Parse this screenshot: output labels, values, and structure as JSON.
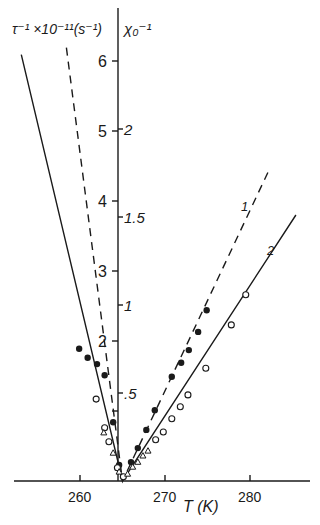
{
  "chart_data": {
    "type": "scatter",
    "title": "",
    "xlabel": "T (K)",
    "ylabel_left": "τ⁻¹ ×10⁻¹¹(s⁻¹)",
    "ylabel_right": "χ₀⁻¹",
    "xlim": [
      253,
      287
    ],
    "ylim_left": [
      0,
      6.7
    ],
    "ylim_right": [
      0,
      2.7
    ],
    "x_ticks": [
      260,
      270,
      280
    ],
    "y_ticks_left": [
      1,
      2,
      3,
      4,
      5,
      6
    ],
    "y_tick_labels_left": [
      "",
      "2",
      "3",
      "4",
      "5",
      "6"
    ],
    "y_ticks_right": [
      0.5,
      1,
      1.5,
      2
    ],
    "y_tick_labels_right": [
      ".5",
      "1",
      "1.5",
      "2"
    ],
    "grid": false,
    "legend": "none",
    "annotations": [
      {
        "text": "1",
        "near": "dashed line (right branch)"
      },
      {
        "text": "2",
        "near": "solid line (right branch)"
      }
    ],
    "series": [
      {
        "name": "τ⁻¹ (filled circles)",
        "marker": "filled-circle",
        "points": [
          [
            259.9,
            1.89
          ],
          [
            260.9,
            1.76
          ],
          [
            262.0,
            1.67
          ],
          [
            262.9,
            1.51
          ],
          [
            263.9,
            0.84
          ],
          [
            264.6,
            0.23
          ],
          [
            266.0,
            0.27
          ],
          [
            266.8,
            0.47
          ],
          [
            267.8,
            0.73
          ],
          [
            268.8,
            1.01
          ],
          [
            270.8,
            1.49
          ],
          [
            271.9,
            1.69
          ],
          [
            272.8,
            1.87
          ],
          [
            273.9,
            2.13
          ],
          [
            274.9,
            2.44
          ]
        ]
      },
      {
        "name": "χ₀⁻¹ (open circles)",
        "marker": "open-circle",
        "points": [
          [
            261.9,
            1.17
          ],
          [
            262.9,
            0.76
          ],
          [
            263.4,
            0.56
          ],
          [
            264.4,
            0.19
          ],
          [
            265.1,
            0.06
          ],
          [
            268.9,
            0.59
          ],
          [
            269.8,
            0.7
          ],
          [
            270.8,
            0.89
          ],
          [
            271.8,
            1.06
          ],
          [
            272.7,
            1.23
          ],
          [
            274.8,
            1.61
          ],
          [
            277.8,
            2.23
          ],
          [
            279.5,
            2.66
          ]
        ]
      },
      {
        "name": "open triangles",
        "marker": "open-triangle",
        "points": [
          [
            262.8,
            0.69
          ],
          [
            263.9,
            0.4
          ],
          [
            264.6,
            0.13
          ],
          [
            265.6,
            0.1
          ],
          [
            266.2,
            0.2
          ],
          [
            266.8,
            0.27
          ],
          [
            267.4,
            0.36
          ],
          [
            268.0,
            0.43
          ]
        ]
      },
      {
        "name": "line 1 (dashed)",
        "style": "dashed",
        "points": [
          [
            258.4,
            6.19
          ],
          [
            265.0,
            0.0
          ],
          [
            282.3,
            4.46
          ]
        ]
      },
      {
        "name": "line 2 (solid)",
        "style": "solid",
        "points": [
          [
            253.1,
            6.09
          ],
          [
            265.0,
            0.0
          ],
          [
            285.4,
            3.8
          ]
        ]
      }
    ]
  },
  "labels": {
    "ylabel_left": "τ⁻¹ ×10⁻¹¹(s⁻¹)",
    "ylabel_right": "χ₀⁻¹",
    "xlabel": "T (K)",
    "line1": "1",
    "line2": "2"
  }
}
